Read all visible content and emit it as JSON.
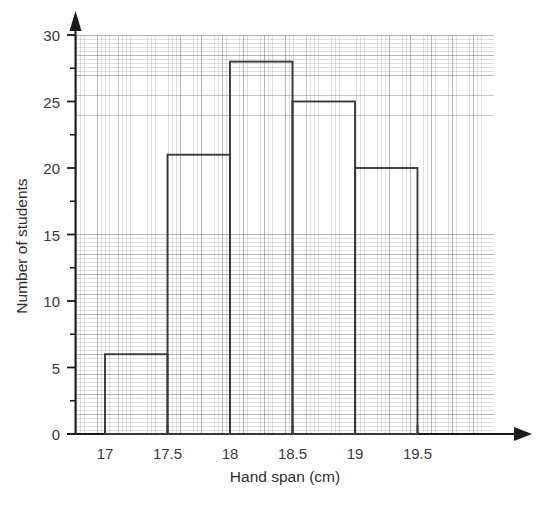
{
  "chart_data": {
    "type": "bar",
    "title": "",
    "subtitle": "",
    "xlabel": "Hand span (cm)",
    "ylabel": "Number of students",
    "bin_edges": [
      17,
      17.5,
      18,
      18.5,
      19,
      19.5
    ],
    "categories": [
      "17-17.5",
      "17.5-18",
      "18-18.5",
      "18.5-19",
      "19-19.5"
    ],
    "values": [
      6,
      21,
      28,
      25,
      20
    ],
    "bars": [
      {
        "from": 17,
        "to": 17.5,
        "value": 6
      },
      {
        "from": 17.5,
        "to": 18,
        "value": 21
      },
      {
        "from": 18,
        "to": 18.5,
        "value": 28
      },
      {
        "from": 18.5,
        "to": 19,
        "value": 25
      },
      {
        "from": 19,
        "to": 19.5,
        "value": 20
      }
    ],
    "xlim": [
      16.77,
      20.1
    ],
    "ylim": [
      0,
      30
    ],
    "x_tick_labels": [
      "17",
      "17.5",
      "18",
      "18.5",
      "19",
      "19.5"
    ],
    "x_tick_values": [
      17,
      17.5,
      18,
      18.5,
      19,
      19.5
    ],
    "y_tick_labels": [
      "0",
      "5",
      "10",
      "15",
      "20",
      "25",
      "30"
    ],
    "y_tick_values": [
      0,
      5,
      10,
      15,
      20,
      25,
      30
    ],
    "y_minor_tick_values": [
      2.5,
      7.5,
      12.5,
      17.5,
      22.5,
      27.5
    ],
    "grid": true,
    "grid_style": "graph-paper",
    "legend": "none",
    "bar_fill": "none",
    "bar_stroke": "#3a3a3a",
    "axis_color": "#1a1a1a",
    "axis_arrows": true,
    "annotations": []
  },
  "axes": {
    "y_title": "Number of students",
    "x_title": "Hand span (cm)"
  }
}
